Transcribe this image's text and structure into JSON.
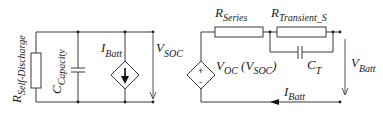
{
  "diagram": {
    "type": "equivalent-circuit",
    "colors": {
      "line": "#3a3a3a",
      "text": "#222222",
      "background": "#ffffff"
    },
    "left_circuit": {
      "r_self_discharge": {
        "main": "R",
        "sub": "Self-Discharge"
      },
      "c_capacity": {
        "main": "C",
        "sub": "Capacity"
      },
      "i_batt_source": {
        "main": "I",
        "sub": "Batt"
      },
      "v_soc": {
        "main": "V",
        "sub": "SOC"
      }
    },
    "right_circuit": {
      "r_series": {
        "main": "R",
        "sub": "Series"
      },
      "r_transient": {
        "main": "R",
        "sub": "Transient_S"
      },
      "c_transient": {
        "main": "C",
        "sub": "T"
      },
      "v_oc_source": {
        "main": "V",
        "sub": "OC",
        "paren_open": " (V",
        "paren_sub": "SOC",
        "paren_close": ")",
        "plus": "+",
        "minus": "-"
      },
      "v_batt": {
        "main": "V",
        "sub": "Batt"
      },
      "i_batt": {
        "main": "I",
        "sub": "Batt"
      }
    }
  }
}
